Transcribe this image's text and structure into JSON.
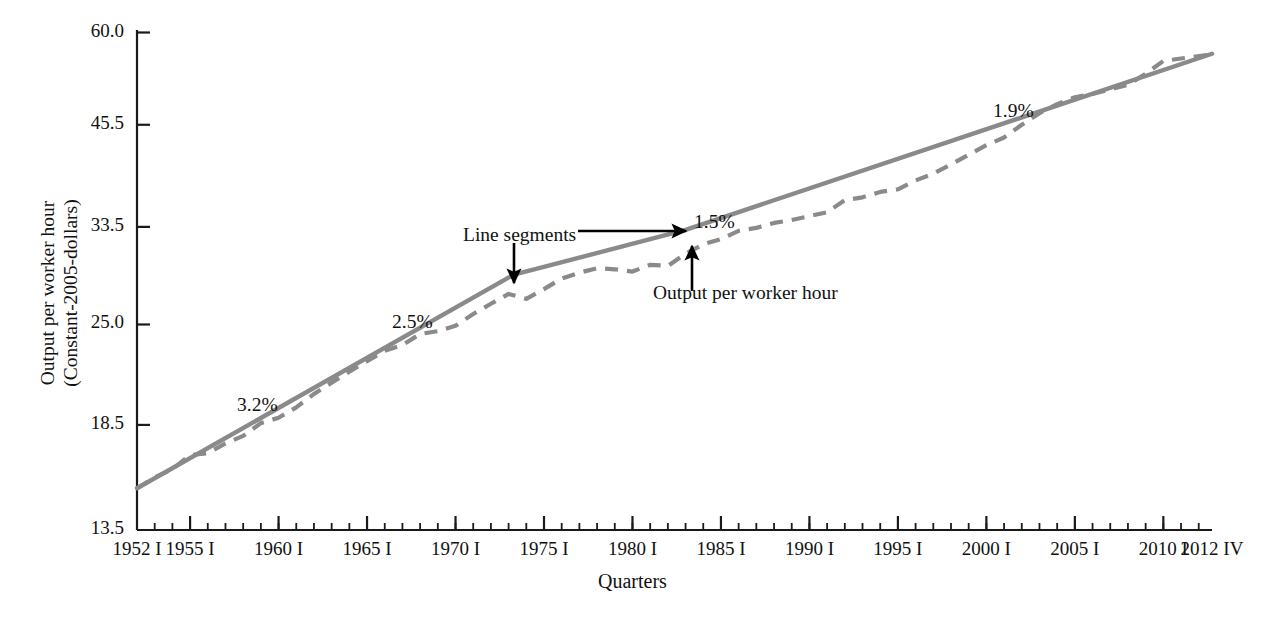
{
  "chart_data": {
    "type": "line",
    "title": "",
    "xlabel": "Quarters",
    "ylabel": "Output per worker hour",
    "ylabel_line2": "(Constant-2005-dollars)",
    "grid": false,
    "legend_position": "none",
    "yscale": "log",
    "ylim": [
      13.5,
      60.0
    ],
    "ytick_labels": [
      "60.0",
      "45.5",
      "33.5",
      "25.0",
      "18.5",
      "13.5"
    ],
    "ytick_values": [
      60.0,
      45.5,
      33.5,
      25.0,
      18.5,
      13.5
    ],
    "xtick_labels": [
      "1952 I",
      "1955 I",
      "1960 I",
      "1965 I",
      "1970 I",
      "1975 I",
      "1980 I",
      "1985 I",
      "1990 I",
      "1995 I",
      "2000 I",
      "2005 I",
      "2010 I",
      "2012 IV"
    ],
    "xtick_years": [
      1952,
      1955,
      1960,
      1965,
      1970,
      1975,
      1980,
      1985,
      1990,
      1995,
      2000,
      2005,
      2010,
      2012.75
    ],
    "xlim": [
      1952,
      2012.75
    ],
    "minor_tick_interval_years": 1,
    "series": [
      {
        "name": "Output per worker hour",
        "style": "dashed",
        "color": "#8a8a8a",
        "x": [
          1952,
          1953,
          1954,
          1955,
          1956,
          1957,
          1958,
          1959,
          1960,
          1961,
          1962,
          1963,
          1964,
          1965,
          1966,
          1967,
          1968,
          1969,
          1970,
          1971,
          1972,
          1973,
          1974,
          1975,
          1976,
          1977,
          1978,
          1979,
          1980,
          1981,
          1982,
          1983,
          1984,
          1985,
          1986,
          1987,
          1988,
          1989,
          1990,
          1991,
          1992,
          1993,
          1994,
          1995,
          1996,
          1997,
          1998,
          1999,
          2000,
          2001,
          2002,
          2003,
          2004,
          2005,
          2006,
          2007,
          2008,
          2009,
          2010,
          2011,
          2012.75
        ],
        "values": [
          15.3,
          15.8,
          16.2,
          16.9,
          17.0,
          17.5,
          17.9,
          18.6,
          18.9,
          19.5,
          20.3,
          21.0,
          21.7,
          22.4,
          23.1,
          23.5,
          24.3,
          24.5,
          24.9,
          25.8,
          26.6,
          27.4,
          27.0,
          27.8,
          28.7,
          29.2,
          29.6,
          29.5,
          29.3,
          29.9,
          29.8,
          30.9,
          31.8,
          32.3,
          33.1,
          33.4,
          33.9,
          34.2,
          34.6,
          35.0,
          36.3,
          36.6,
          37.2,
          37.5,
          38.5,
          39.3,
          40.4,
          41.6,
          42.8,
          43.8,
          45.5,
          47.1,
          48.4,
          49.4,
          49.9,
          50.6,
          51.3,
          53.0,
          55.1,
          55.5,
          56.2
        ]
      },
      {
        "name": "Line segments",
        "style": "solid",
        "color": "#8a8a8a",
        "breakpoints_x": [
          1952,
          1973.25,
          1983,
          2012.75
        ],
        "breakpoints_y": [
          15.3,
          29.0,
          33.2,
          56.3
        ]
      }
    ],
    "annotations": [
      {
        "id": "rate-1",
        "text": "3.2%",
        "x_px": 237,
        "y_px": 394,
        "type": "growth-rate"
      },
      {
        "id": "rate-2",
        "text": "2.5%",
        "x_px": 392,
        "y_px": 311,
        "type": "growth-rate"
      },
      {
        "id": "rate-3",
        "text": "1.5%",
        "x_px": 694,
        "y_px": 211,
        "type": "growth-rate"
      },
      {
        "id": "rate-4",
        "text": "1.9%",
        "x_px": 993,
        "y_px": 100,
        "type": "growth-rate"
      },
      {
        "id": "callout-1",
        "text": "Line segments",
        "x_px": 463,
        "y_px": 224,
        "type": "callout"
      },
      {
        "id": "callout-2",
        "text": "Output per worker hour",
        "x_px": 653,
        "y_px": 282,
        "type": "callout"
      }
    ]
  },
  "figure": {
    "bg_color": "#ffffff",
    "axis_color": "#1a1a1a",
    "line_color": "#8a8a8a",
    "annotation_color": "#000000",
    "text_color": "#111111"
  }
}
